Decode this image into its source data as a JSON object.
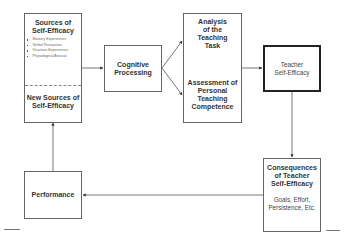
{
  "diagram": {
    "sources_box": {
      "title": "Sources of Self-Efficacy",
      "title_line1": "Sources of",
      "title_line2": "Self-Efficacy",
      "items": [
        "Mastery Experiences",
        "Verbal Persuasion",
        "Vicarious Experiences",
        "Physiological Arousal"
      ],
      "new_sources_line1": "New Sources of",
      "new_sources_line2": "Self-Efficacy"
    },
    "cognitive_box": {
      "line1": "Cognitive",
      "line2": "Processing"
    },
    "analysis_box": {
      "top_lines": [
        "Analysis",
        "of the",
        "Teaching",
        "Task"
      ],
      "bottom_lines": [
        "Assessment of",
        "Personal",
        "Teaching",
        "Competence"
      ]
    },
    "teacher_box": {
      "line1": "Teacher",
      "line2": "Self-Efficacy"
    },
    "consequences_box": {
      "title_lines": [
        "Consequences",
        "of Teacher",
        "Self-Efficacy"
      ],
      "detail_lines": [
        "Goals, Effort,",
        "Persistence, Etc."
      ]
    },
    "performance_box": {
      "label": "Performance"
    },
    "colors": {
      "line": "#555555",
      "box_border": "#666666",
      "emphasis_border": "#222222"
    }
  }
}
